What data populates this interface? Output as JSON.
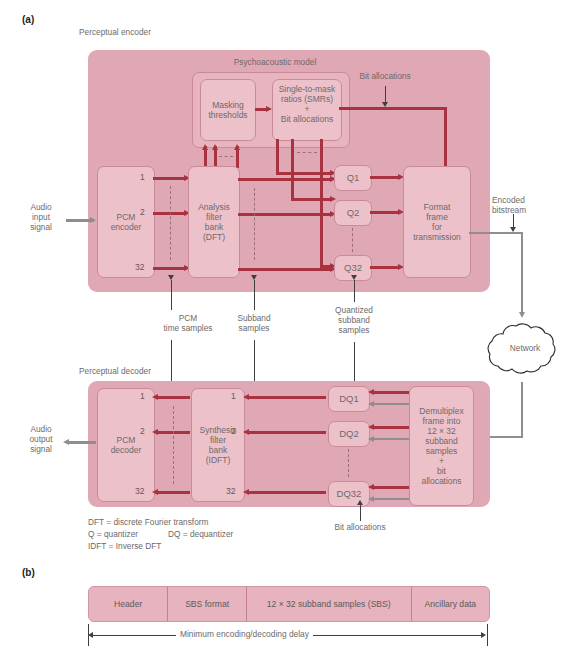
{
  "figure": {
    "part_a_label": "(a)",
    "part_b_label": "(b)"
  },
  "encoder": {
    "title": "Perceptual encoder",
    "psychoacoustic_title": "Psychoacoustic model",
    "masking_box": "Masking\nthresholds",
    "smr_box_line1": "Single-to-mask",
    "smr_box_line2": "ratios (SMRs)",
    "smr_box_line3": "+",
    "smr_box_line4": "Bit allocations",
    "bit_allocations_label": "Bit allocations",
    "pcm_encoder": "PCM\nencoder",
    "analysis_filter_bank": "Analysis\nfilter\nbank\n(DFT)",
    "format_frame": "Format\nframe\nfor\ntransmission",
    "audio_input": "Audio\ninput\nsignal",
    "encoded_bitstream": "Encoded\nbitstream",
    "channel_numbers": [
      "1",
      "2",
      "32"
    ],
    "quantizers": [
      "Q1",
      "Q2",
      "Q32"
    ]
  },
  "middle_labels": {
    "pcm_time_samples": "PCM\ntime samples",
    "subband_samples": "Subband\nsamples",
    "quantized_subband_samples": "Quantized\nsubband\nsamples",
    "network": "Network"
  },
  "decoder": {
    "title": "Perceptual decoder",
    "pcm_decoder": "PCM\ndecoder",
    "synthesis_filter_bank": "Synthesis\nfilter\nbank\n(IDFT)",
    "demultiplex": "Demultiplex\nframe into\n12 × 32\nsubband\nsamples\n+\nbit\nallocations",
    "audio_output": "Audio\noutput\nsignal",
    "channel_numbers": [
      "1",
      "2",
      "32"
    ],
    "dequantizers": [
      "DQ1",
      "DQ2",
      "DQ32"
    ],
    "bit_allocations_label": "Bit allocations"
  },
  "legend": {
    "line1": "DFT = discrete Fourier transform",
    "line2_left": "Q = quantizer",
    "line2_right": "DQ = dequantizer",
    "line3": "IDFT = Inverse DFT"
  },
  "frame": {
    "cells": [
      "Header",
      "SBS format",
      "12 × 32 subband samples (SBS)",
      "Ancillary data"
    ],
    "delay_label": "Minimum encoding/decoding delay"
  },
  "colors": {
    "panel": "#e0a7b4",
    "box": "#ecc1c9",
    "connector": "#a8323f",
    "gray_connector": "#8e8e8e",
    "text": "#6e6a6a"
  }
}
